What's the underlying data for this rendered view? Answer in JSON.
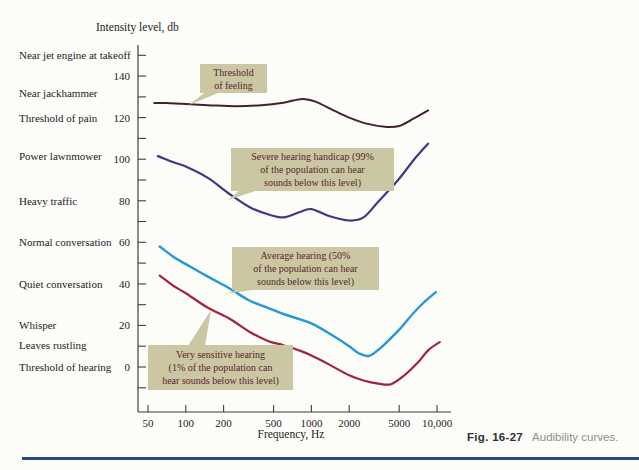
{
  "figure": {
    "y_axis_title": "Intensity level, db",
    "x_axis_title": "Frequency, Hz",
    "caption_label": "Fig. 16-27",
    "caption_text": "Audibility curves."
  },
  "colors": {
    "paper": "#fcfcf9",
    "axis": "#3f3f3f",
    "callout_bg": "#cbc7a3",
    "callout_text": "#56262e",
    "caption_label": "#2f2f2f",
    "caption_gray": "#8e8e8e",
    "bottom_rule": "#2a4a84"
  },
  "sound_scale": {
    "items": [
      {
        "label": "Near jet engine at takeoff",
        "db": 150
      },
      {
        "label": "Near jackhammer",
        "db": 132
      },
      {
        "label": "Threshold of pain",
        "db": 120
      },
      {
        "label": "Power lawnmower",
        "db": 101.5
      },
      {
        "label": "Heavy traffic",
        "db": 80
      },
      {
        "label": "Normal conversation",
        "db": 60
      },
      {
        "label": "Quiet conversation",
        "db": 40
      },
      {
        "label": "Whisper",
        "db": 20
      },
      {
        "label": "Leaves rustling",
        "db": 10.5
      },
      {
        "label": "Threshold of hearing",
        "db": 0
      }
    ]
  },
  "chart_data": {
    "type": "line",
    "title": "Audibility curves",
    "xlabel": "Frequency, Hz",
    "ylabel": "Intensity level, db",
    "x_scale": "log",
    "x_range": [
      50,
      10000
    ],
    "y_range": [
      -10,
      150
    ],
    "grid": false,
    "legend_position": "inline-callouts",
    "y_tick_labels": [
      140,
      120,
      100,
      80,
      60,
      40,
      20,
      0
    ],
    "y_minor_tick_step": 10,
    "y_minor_tick_top": 150,
    "y_minor_tick_bottom": -10,
    "x_ticks": [
      {
        "value": 50,
        "label": "50"
      },
      {
        "value": 100,
        "label": "100"
      },
      {
        "value": 200,
        "label": "200"
      },
      {
        "value": 500,
        "label": "500"
      },
      {
        "value": 1000,
        "label": "1000"
      },
      {
        "value": 2000,
        "label": "2000"
      },
      {
        "value": 5000,
        "label": "5000"
      },
      {
        "value": 10000,
        "label": "10,000"
      }
    ],
    "series": [
      {
        "name": "Threshold of feeling",
        "color": "#45222b",
        "width": 2,
        "points": [
          [
            56,
            127
          ],
          [
            70,
            127
          ],
          [
            100,
            126.5
          ],
          [
            150,
            126
          ],
          [
            250,
            125.5
          ],
          [
            400,
            126
          ],
          [
            600,
            127.2
          ],
          [
            850,
            129
          ],
          [
            1100,
            127.5
          ],
          [
            1500,
            123.5
          ],
          [
            2000,
            120
          ],
          [
            2800,
            117
          ],
          [
            4000,
            115.5
          ],
          [
            5000,
            116
          ],
          [
            6500,
            119.5
          ],
          [
            8500,
            123.5
          ]
        ]
      },
      {
        "name": "Severe hearing handicap (99% of the population can hear sounds below this level)",
        "color": "#3e3a81",
        "width": 2.2,
        "points": [
          [
            60,
            101.5
          ],
          [
            80,
            98.5
          ],
          [
            100,
            96.5
          ],
          [
            150,
            91
          ],
          [
            220,
            83.5
          ],
          [
            320,
            77
          ],
          [
            450,
            73.5
          ],
          [
            600,
            72
          ],
          [
            800,
            74.5
          ],
          [
            1000,
            76
          ],
          [
            1400,
            72.5
          ],
          [
            2000,
            70.5
          ],
          [
            2600,
            72
          ],
          [
            3400,
            79.5
          ],
          [
            4900,
            90
          ],
          [
            6500,
            99.5
          ],
          [
            8500,
            107.5
          ]
        ]
      },
      {
        "name": "Average hearing (50% of the population can hear sounds below this level)",
        "color": "#2598d5",
        "width": 2.4,
        "points": [
          [
            62,
            58
          ],
          [
            80,
            53
          ],
          [
            100,
            49.5
          ],
          [
            150,
            43.5
          ],
          [
            220,
            38
          ],
          [
            320,
            32
          ],
          [
            450,
            28.5
          ],
          [
            600,
            25.5
          ],
          [
            800,
            23
          ],
          [
            1000,
            21
          ],
          [
            1400,
            16
          ],
          [
            2000,
            10
          ],
          [
            2400,
            6.5
          ],
          [
            2900,
            5.4
          ],
          [
            3600,
            9.5
          ],
          [
            5000,
            18
          ],
          [
            6500,
            26
          ],
          [
            8000,
            31.5
          ],
          [
            9800,
            36
          ]
        ]
      },
      {
        "name": "Very sensitive hearing (1% of the population can hear sounds below this level)",
        "color": "#a02441",
        "width": 2.2,
        "points": [
          [
            62,
            44
          ],
          [
            80,
            39
          ],
          [
            100,
            35.5
          ],
          [
            150,
            28.5
          ],
          [
            220,
            23.5
          ],
          [
            320,
            17
          ],
          [
            450,
            12.5
          ],
          [
            600,
            10.5
          ],
          [
            800,
            8
          ],
          [
            1000,
            5.5
          ],
          [
            1400,
            1
          ],
          [
            2000,
            -4
          ],
          [
            2600,
            -6.5
          ],
          [
            3400,
            -8
          ],
          [
            4300,
            -8.3
          ],
          [
            5500,
            -4
          ],
          [
            7000,
            2
          ],
          [
            8500,
            8
          ],
          [
            10500,
            12
          ]
        ]
      }
    ],
    "layout": {
      "x_min": 50,
      "x_px_at_min": 148,
      "x_px_per_decade": 125.6,
      "y_px_at_zero": 367,
      "y_px_per_db": 2.078,
      "y_axis_x": 138,
      "y_axis_top": 45,
      "y_axis_bottom": 412,
      "x_axis_y": 412,
      "x_axis_right": 451,
      "tick_len": 8,
      "x_tick_label_y": 417
    }
  },
  "annotations": [
    {
      "id": "threshold-of-feeling",
      "lines": [
        "Threshold",
        "of feeling"
      ],
      "box": {
        "left": 200,
        "top": 64,
        "width": 67,
        "height": 29
      },
      "tail": [
        [
          204,
          93
        ],
        [
          218,
          93
        ],
        [
          189,
          105
        ]
      ]
    },
    {
      "id": "severe-hearing-handicap",
      "lines": [
        "Severe hearing handicap (99%",
        "of the population can hear",
        "sounds below this level)"
      ],
      "box": {
        "left": 231,
        "top": 148,
        "width": 163,
        "height": 43
      },
      "tail": [
        [
          240,
          190
        ],
        [
          258,
          190
        ],
        [
          228,
          200
        ]
      ]
    },
    {
      "id": "average-hearing",
      "lines": [
        "Average hearing (50%",
        "of the population can hear",
        "sounds below this level)"
      ],
      "box": {
        "left": 232,
        "top": 247,
        "width": 147,
        "height": 43
      },
      "tail": [
        [
          242,
          289
        ],
        [
          260,
          289
        ],
        [
          223,
          294
        ]
      ]
    },
    {
      "id": "very-sensitive-hearing",
      "lines": [
        "Very sensitive hearing",
        "(1% of the population can",
        "hear sounds below this level)"
      ],
      "box": {
        "left": 148,
        "top": 345,
        "width": 145,
        "height": 45
      },
      "tail": [
        [
          188,
          346
        ],
        [
          205,
          346
        ],
        [
          211,
          310
        ]
      ]
    }
  ]
}
